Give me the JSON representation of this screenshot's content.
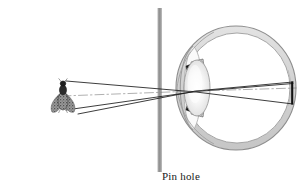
{
  "figure": {
    "type": "optics-ray-diagram",
    "title_visible": false,
    "labels": {
      "pin_hole": "Pin hole"
    },
    "colors": {
      "background": "#ffffff",
      "ray_line": "#1a1a1a",
      "barrier_gray": "#9a9a9a",
      "sclera_fill": "#d7d7d7",
      "sclera_outline": "#8d8d8d",
      "vitreous_fill": "#ffffff",
      "lens_light": "#fbfbfb",
      "lens_mid": "#e2e2e2",
      "lens_edge": "#b4b4b4",
      "iris_black": "#111111",
      "ciliary_gray": "#c9c9c9",
      "fly_body": "#2a2a2a",
      "fly_wing": "#8f8f8f",
      "retina_image": "#111111",
      "label_text": "#1a1a1a"
    },
    "objects": [
      {
        "name": "fly",
        "role": "object",
        "orientation": "upright",
        "x": 62,
        "y": 96,
        "top_y": 80,
        "bottom_y": 112
      },
      {
        "name": "pinhole-barrier",
        "role": "aperture-screen",
        "x": 160,
        "top_y": 8,
        "bottom_y": 172,
        "aperture_y": 95
      },
      {
        "name": "eye",
        "role": "imaging-system",
        "center_x": 236,
        "center_y": 88,
        "radius_x": 60,
        "radius_y": 62
      },
      {
        "name": "retinal-image",
        "role": "image",
        "orientation": "inverted",
        "x": 292,
        "top_y": 82,
        "bottom_y": 104
      }
    ],
    "rays": [
      {
        "name": "ray-from-object-top",
        "from": "fly-head",
        "through": "pinhole",
        "to": "image-bottom"
      },
      {
        "name": "ray-from-object-bottom",
        "from": "fly-wing-tip",
        "through": "pinhole",
        "to": "image-top"
      },
      {
        "name": "optical-axis",
        "from": "fly-center",
        "through": "pinhole",
        "to": "image-center"
      }
    ],
    "eye_parts": [
      "sclera",
      "cornea",
      "anterior-chamber",
      "iris-upper",
      "iris-lower",
      "ciliary-body-upper",
      "ciliary-body-lower",
      "crystalline-lens",
      "vitreous-humor",
      "retina"
    ]
  }
}
